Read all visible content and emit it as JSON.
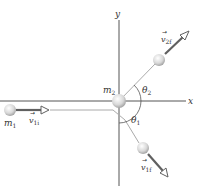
{
  "diagram": {
    "axes": {
      "x_label": "x",
      "y_label": "y"
    },
    "objects": {
      "m1": {
        "label": "m",
        "sub": "1"
      },
      "m2": {
        "label": "m",
        "sub": "2"
      }
    },
    "vectors": {
      "v1i": {
        "label": "v",
        "sub": "1i"
      },
      "v2f": {
        "label": "v",
        "sub": "2f"
      },
      "v1f": {
        "label": "v",
        "sub": "1f"
      }
    },
    "angles": {
      "theta1": {
        "label": "θ",
        "sub": "1"
      },
      "theta2": {
        "label": "θ",
        "sub": "2"
      }
    },
    "colors": {
      "axis": "#555555",
      "path": "#aaaaaa",
      "vector": "#606060",
      "ball": "#cfcfcf"
    }
  }
}
